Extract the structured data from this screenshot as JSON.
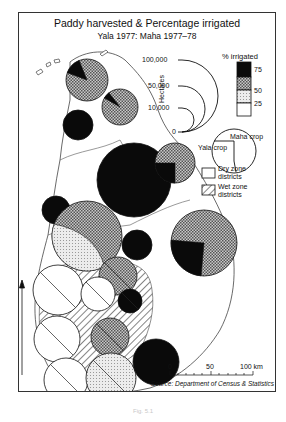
{
  "map": {
    "title": "Paddy harvested & Percentage irrigated",
    "subtitle": "Yala 1977: Maha 1977–78",
    "source": "Source: Department of Census & Statistics",
    "caption": "Fig. 5.1",
    "colors": {
      "ink": "#111111",
      "frame": "#333333",
      "coast": "#444444",
      "dark": "#0a0a0a",
      "mid": "#9a9a9a",
      "light": "#d6d6d6",
      "white": "#ffffff"
    },
    "legend": {
      "size_axis_label": "Hectares",
      "size_ticks": [
        {
          "label": "100,000",
          "value": 100000
        },
        {
          "label": "50,000",
          "value": 50000
        },
        {
          "label": "10,000",
          "value": 10000
        },
        {
          "label": "0",
          "value": 0
        }
      ],
      "irrigated_title": "% irrigated",
      "irrigated_classes": [
        {
          "label": "75",
          "range": ">75",
          "fill": "dark"
        },
        {
          "label": "50",
          "range": "50–75",
          "fill": "mid"
        },
        {
          "label": "25",
          "range": "25–50",
          "fill": "light"
        },
        {
          "label": "",
          "range": "<25",
          "fill": "white"
        }
      ],
      "crop_labels": {
        "maha": "Maha crop",
        "yala": "Yala crop"
      },
      "zone_labels": {
        "dry": "Dry zone districts",
        "wet": "Wet zone districts"
      }
    },
    "scale_bar": {
      "ticks": [
        "0",
        "50",
        "100 km"
      ]
    },
    "north_arrow": true
  },
  "chart_data": {
    "type": "map-proportional-pie",
    "title": "Paddy harvested & Percentage irrigated",
    "subtitle": "Yala 1977: Maha 1977–78",
    "encoding": {
      "circle_area": "hectares of paddy harvested",
      "circle_split": "Yala crop (sector) vs Maha crop",
      "fill": "% irrigated class"
    },
    "districts": [
      {
        "id": "jaffna",
        "cx": 87,
        "cy": 80,
        "r": 21,
        "fill": "mid",
        "zone": "dry",
        "sector_fill": "dark",
        "sector_from": 200,
        "sector_to": 248
      },
      {
        "id": "mullaitivu",
        "cx": 120,
        "cy": 107,
        "r": 18,
        "fill": "mid",
        "zone": "dry",
        "sector_fill": "dark",
        "sector_from": 210,
        "sector_to": 232
      },
      {
        "id": "mannar",
        "cx": 78,
        "cy": 125,
        "r": 15,
        "fill": "dark",
        "zone": "dry"
      },
      {
        "id": "anuradhapura",
        "cx": 134,
        "cy": 180,
        "r": 37,
        "fill": "dark",
        "zone": "dry"
      },
      {
        "id": "trincomalee",
        "cx": 175,
        "cy": 163,
        "r": 20,
        "fill": "mid",
        "zone": "dry",
        "sector_fill": "dark",
        "sector_from": 90,
        "sector_to": 180
      },
      {
        "id": "puttalam",
        "cx": 56,
        "cy": 210,
        "r": 14,
        "fill": "dark",
        "zone": "dry"
      },
      {
        "id": "kurunegala",
        "cx": 87,
        "cy": 236,
        "r": 35,
        "fill": "mid",
        "zone": "dry",
        "half_fill": "light"
      },
      {
        "id": "polonnaruwa",
        "cx": 137,
        "cy": 245,
        "r": 15,
        "fill": "dark",
        "zone": "dry"
      },
      {
        "id": "batticaloa",
        "cx": 204,
        "cy": 243,
        "r": 33,
        "fill": "mid",
        "zone": "dry",
        "sector_fill": "dark",
        "sector_from": 95,
        "sector_to": 185
      },
      {
        "id": "matale",
        "cx": 118,
        "cy": 276,
        "r": 19,
        "fill": "mid",
        "zone": "wet"
      },
      {
        "id": "gampaha",
        "cx": 58,
        "cy": 290,
        "r": 25,
        "fill": "white",
        "zone": "wet"
      },
      {
        "id": "kandy",
        "cx": 98,
        "cy": 294,
        "r": 17,
        "fill": "white",
        "zone": "wet"
      },
      {
        "id": "badulla",
        "cx": 130,
        "cy": 301,
        "r": 12,
        "fill": "dark",
        "zone": "wet"
      },
      {
        "id": "colombo",
        "cx": 57,
        "cy": 339,
        "r": 23,
        "fill": "white",
        "zone": "wet"
      },
      {
        "id": "kegalle",
        "cx": 110,
        "cy": 337,
        "r": 19,
        "fill": "mid",
        "zone": "wet"
      },
      {
        "id": "kalutara",
        "cx": 66,
        "cy": 380,
        "r": 22,
        "fill": "white",
        "zone": "wet"
      },
      {
        "id": "ratnapura",
        "cx": 111,
        "cy": 378,
        "r": 25,
        "fill": "light",
        "zone": "wet"
      },
      {
        "id": "hambantota",
        "cx": 156,
        "cy": 362,
        "r": 23,
        "fill": "dark",
        "zone": "dry"
      }
    ]
  }
}
